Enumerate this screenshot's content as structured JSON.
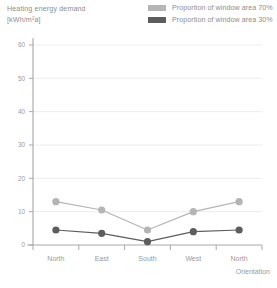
{
  "title": {
    "line1": "Heating energy demand",
    "line2": "[kWh/m²a]"
  },
  "legend": {
    "position": "top-right",
    "items": [
      {
        "label": "Proportion of window area 70%",
        "color": "#b5b5b5"
      },
      {
        "label": "Proportion of window area 30%",
        "color": "#5d5d5d"
      }
    ]
  },
  "axes": {
    "y_ticks": [
      "0",
      "10",
      "20",
      "30",
      "40",
      "50",
      "60"
    ],
    "x_ticks": [
      "North",
      "East",
      "South",
      "West",
      "North"
    ],
    "x_axis_label": "Orientation"
  },
  "colors": {
    "series_light": "#b5b5b5",
    "series_dark": "#5d5d5d",
    "axis": "#a8a8a8",
    "grid": "#ededed",
    "text": "#8d8d8d"
  },
  "chart_data": {
    "type": "line",
    "title": "Heating energy demand [kWh/m²a]",
    "xlabel": "Orientation",
    "ylabel": "Heating energy demand [kWh/m²a]",
    "categories": [
      "North",
      "East",
      "South",
      "West",
      "North"
    ],
    "ylim": [
      0,
      60
    ],
    "yticks": [
      0,
      10,
      20,
      30,
      40,
      50,
      60
    ],
    "grid": true,
    "legend_position": "top-right",
    "series": [
      {
        "name": "Proportion of window area 70%",
        "color": "#b5b5b5",
        "values": [
          13,
          10.5,
          4.5,
          10,
          13
        ]
      },
      {
        "name": "Proportion of window area 30%",
        "color": "#5d5d5d",
        "values": [
          4.5,
          3.5,
          1,
          4,
          4.5
        ]
      }
    ]
  }
}
